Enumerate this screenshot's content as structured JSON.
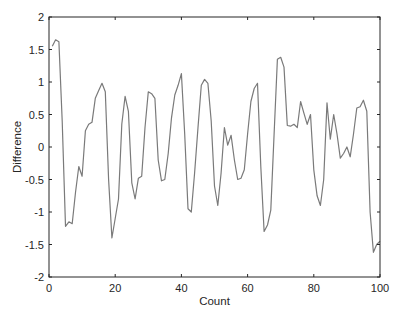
{
  "chart_data": {
    "type": "line",
    "title": "",
    "xlabel": "Count",
    "ylabel": "Difference",
    "xlim": [
      0,
      100
    ],
    "ylim": [
      -2,
      2
    ],
    "xticks": [
      0,
      20,
      40,
      60,
      80,
      100
    ],
    "yticks": [
      -2,
      -1.5,
      -1,
      -0.5,
      0,
      0.5,
      1,
      1.5,
      2
    ],
    "xtick_labels": [
      "0",
      "20",
      "40",
      "60",
      "80",
      "100"
    ],
    "ytick_labels": [
      "-2",
      "-1.5",
      "-1",
      "-0.5",
      "0",
      "0.5",
      "1",
      "1.5",
      "2"
    ],
    "grid": false,
    "legend": null,
    "line_color": "#7a7a7a",
    "series": [
      {
        "name": "Difference",
        "x": [
          1,
          2,
          3,
          4,
          5,
          6,
          7,
          8,
          9,
          10,
          11,
          12,
          13,
          14,
          15,
          16,
          17,
          18,
          19,
          20,
          21,
          22,
          23,
          24,
          25,
          26,
          27,
          28,
          29,
          30,
          31,
          32,
          33,
          34,
          35,
          36,
          37,
          38,
          39,
          40,
          41,
          42,
          43,
          44,
          45,
          46,
          47,
          48,
          49,
          50,
          51,
          52,
          53,
          54,
          55,
          56,
          57,
          58,
          59,
          60,
          61,
          62,
          63,
          64,
          65,
          66,
          67,
          68,
          69,
          70,
          71,
          72,
          73,
          74,
          75,
          76,
          77,
          78,
          79,
          80,
          81,
          82,
          83,
          84,
          85,
          86,
          87,
          88,
          89,
          90,
          91,
          92,
          93,
          94,
          95,
          96,
          97,
          98,
          99,
          100
        ],
        "values": [
          1.55,
          1.65,
          1.62,
          0.4,
          -1.22,
          -1.15,
          -1.18,
          -0.7,
          -0.3,
          -0.45,
          0.25,
          0.35,
          0.38,
          0.75,
          0.87,
          0.98,
          0.85,
          -0.5,
          -1.4,
          -1.1,
          -0.8,
          0.35,
          0.78,
          0.55,
          -0.55,
          -0.8,
          -0.48,
          -0.45,
          0.3,
          0.85,
          0.82,
          0.75,
          -0.2,
          -0.52,
          -0.5,
          -0.1,
          0.45,
          0.8,
          0.95,
          1.13,
          0.2,
          -0.95,
          -1.0,
          -0.4,
          0.3,
          0.95,
          1.04,
          0.98,
          0.4,
          -0.6,
          -0.9,
          -0.4,
          0.3,
          0.03,
          0.18,
          -0.2,
          -0.5,
          -0.48,
          -0.35,
          0.2,
          0.7,
          0.9,
          0.98,
          -0.3,
          -1.3,
          -1.2,
          -0.97,
          0.2,
          1.35,
          1.38,
          1.23,
          0.33,
          0.32,
          0.35,
          0.3,
          0.7,
          0.52,
          0.35,
          0.5,
          -0.35,
          -0.75,
          -0.9,
          -0.5,
          0.68,
          0.12,
          0.5,
          0.2,
          -0.17,
          -0.1,
          0.0,
          -0.15,
          0.2,
          0.6,
          0.62,
          0.72,
          0.55,
          -1.0,
          -1.62,
          -1.5,
          -1.45
        ]
      }
    ]
  }
}
